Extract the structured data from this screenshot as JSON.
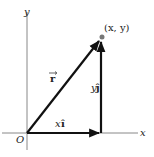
{
  "diagram": {
    "axes": {
      "x_label": "x",
      "y_label": "y",
      "origin_label": "O"
    },
    "point": {
      "label": "(x, y)"
    },
    "vectors": [
      {
        "name": "r",
        "label": "r",
        "from": "O",
        "to": "(x, y)"
      },
      {
        "name": "x_component",
        "label_scalar": "x",
        "label_unit": "î",
        "from": "O",
        "to": "(x, 0)"
      },
      {
        "name": "y_component",
        "label_scalar": "y",
        "label_unit": "ĵ",
        "from": "(x, 0)",
        "to": "(x, y)"
      }
    ],
    "colors": {
      "axis": "#888888",
      "vector": "#111111",
      "point": "#777777"
    }
  }
}
